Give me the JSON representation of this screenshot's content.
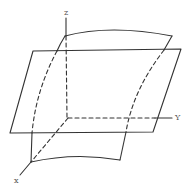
{
  "diagram": {
    "type": "3d-axes-plane-and-curved-surface",
    "axes": {
      "z_label": "z",
      "y_label": "Y",
      "x_label": "x"
    },
    "colors": {
      "stroke": "#333333",
      "label": "#555555",
      "background": "#ffffff"
    },
    "elements": [
      {
        "name": "flat-plane",
        "shape": "parallelogram"
      },
      {
        "name": "curved-surface",
        "shape": "curved-sheet"
      },
      {
        "name": "z-axis"
      },
      {
        "name": "y-axis"
      },
      {
        "name": "x-axis"
      }
    ]
  }
}
